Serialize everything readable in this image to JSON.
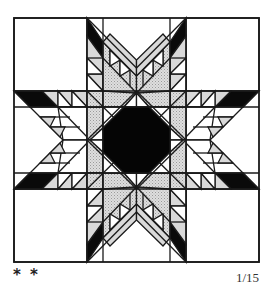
{
  "figure": {
    "colors": {
      "outline": "#1a1a1a",
      "background": "#ffffff",
      "dark": "#0a0a0a",
      "light_gray": "#d9d9d9",
      "stipple_gray": "#cfcfcf"
    }
  },
  "footer": {
    "difficulty": "* *",
    "page_number": "1/15"
  }
}
